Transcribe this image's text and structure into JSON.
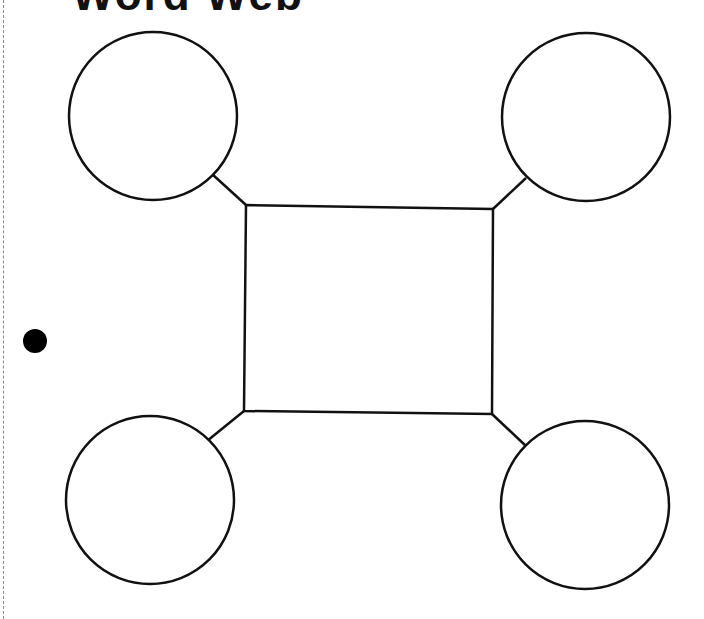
{
  "worksheet": {
    "title": "Word Web",
    "colors": {
      "stroke": "#111111",
      "background": "#ffffff",
      "hole": "#000000"
    }
  },
  "diagram": {
    "center_box": {
      "label": "",
      "points": [
        [
          246,
          205
        ],
        [
          493,
          209
        ],
        [
          492,
          414
        ],
        [
          244,
          411
        ]
      ]
    },
    "circles": [
      {
        "position": "top-left",
        "label": "",
        "cx": 153,
        "cy": 116,
        "r": 84
      },
      {
        "position": "top-right",
        "label": "",
        "cx": 586,
        "cy": 117,
        "r": 84
      },
      {
        "position": "bottom-left",
        "label": "",
        "cx": 150,
        "cy": 500,
        "r": 84
      },
      {
        "position": "bottom-right",
        "label": "",
        "cx": 585,
        "cy": 505,
        "r": 84
      }
    ],
    "connectors": [
      {
        "from": "top-left",
        "x1": 212,
        "y1": 174,
        "x2": 246,
        "y2": 205
      },
      {
        "from": "top-right",
        "x1": 526,
        "y1": 178,
        "x2": 493,
        "y2": 209
      },
      {
        "from": "bottom-left",
        "x1": 207,
        "y1": 441,
        "x2": 244,
        "y2": 411
      },
      {
        "from": "bottom-right",
        "x1": 527,
        "y1": 447,
        "x2": 492,
        "y2": 414
      }
    ]
  }
}
